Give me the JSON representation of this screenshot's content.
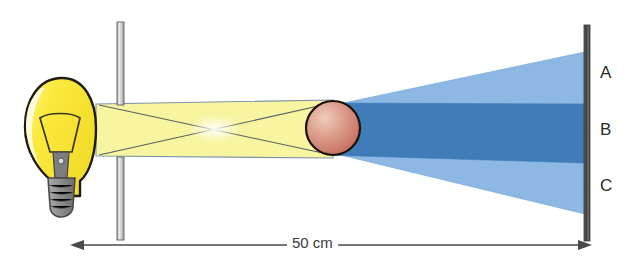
{
  "figure": {
    "type": "optics-ray-diagram",
    "background_color": "#ffffff",
    "width": 629,
    "height": 275
  },
  "source": {
    "name": "light-bulb",
    "glass_color": "#fbe93d",
    "outline_color": "#1d1a12",
    "highlight_color": "#fffde8",
    "base_color": "#8d8d8d",
    "base_outline_color": "#4a4a4a",
    "filament_color": "#6f6f6f"
  },
  "barrier": {
    "name": "slit-barrier",
    "fill_color": "#f2f2f2",
    "outline_color": "#6d6d6d",
    "upper_segment": {
      "x": 117,
      "y": 22,
      "width": 7,
      "height": 82
    },
    "lower_segment": {
      "x": 117,
      "y": 158,
      "width": 7,
      "height": 82
    },
    "aperture_top": 104,
    "aperture_bottom": 158
  },
  "beam": {
    "name": "light-beam",
    "fill_color": "#f7f5a0",
    "edge_color": "#7f93a8",
    "ray_color": "#555f68",
    "crossing_highlight_color": "#ffffff"
  },
  "object": {
    "name": "sphere-object",
    "fill_light": "#e8b9a6",
    "fill_dark": "#c9705f",
    "outline_color": "#1a1208",
    "center_x": 333,
    "center_y": 128,
    "radius": 27
  },
  "shadow": {
    "penumbra_color": "#8cb8e3",
    "umbra_color": "#3f7cb8",
    "penumbra_name": "penumbra-region",
    "umbra_name": "umbra-region"
  },
  "screen": {
    "name": "projection-screen",
    "color": "#4a4a4a",
    "highlight_color": "#8a8a8a",
    "x": 585,
    "top": 25,
    "bottom": 241,
    "labels": [
      {
        "id": "A",
        "text": "A",
        "region": "penumbra-upper"
      },
      {
        "id": "B",
        "text": "B",
        "region": "umbra"
      },
      {
        "id": "C",
        "text": "C",
        "region": "penumbra-lower"
      }
    ]
  },
  "dimension": {
    "name": "distance-dimension",
    "value": "50 cm",
    "line_color": "#4a4a4a",
    "left_x": 72,
    "right_x": 590,
    "y": 245
  }
}
